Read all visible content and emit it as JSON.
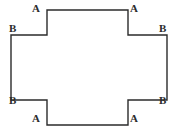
{
  "figure": {
    "name": "cross-shape-polygon",
    "background_color": "#ffffff",
    "stroke_color": "#2b2b2b",
    "stroke_width": 1.4,
    "canvas": {
      "width": 177,
      "height": 138
    },
    "outline_points": "47,10 128,10 128,35 167,35 167,100 128,100 128,125 47,125 47,100 11,100 11,35 47,35 47,10",
    "labels": [
      {
        "id": "a-top-left",
        "text": "A",
        "x": 32,
        "y": 3
      },
      {
        "id": "a-top-right",
        "text": "A",
        "x": 130,
        "y": 3
      },
      {
        "id": "b-top-left",
        "text": "B",
        "x": 9,
        "y": 23
      },
      {
        "id": "b-top-right",
        "text": "B",
        "x": 159,
        "y": 23
      },
      {
        "id": "b-bottom-left",
        "text": "B",
        "x": 9,
        "y": 95
      },
      {
        "id": "b-bottom-right",
        "text": "B",
        "x": 159,
        "y": 95
      },
      {
        "id": "a-bottom-left",
        "text": "A",
        "x": 32,
        "y": 113
      },
      {
        "id": "a-bottom-right",
        "text": "A",
        "x": 130,
        "y": 113
      }
    ]
  }
}
